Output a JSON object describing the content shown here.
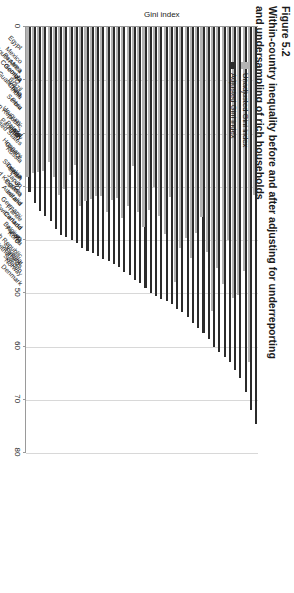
{
  "figure": {
    "number": "Figure 5.2",
    "title_line1": "Within-country inequality before and after adjusting for underreporting",
    "title_line2": "and undersampling of rich households"
  },
  "legend": {
    "position": "top-left-inside",
    "items": [
      {
        "label": "Unadjusted Gini index",
        "color": "#b3b3b3"
      },
      {
        "label": "Adjusted Gini index",
        "color": "#2b2b2b"
      }
    ]
  },
  "axis": {
    "y_title": "Gini index",
    "ticks": [
      "0",
      "10",
      "20",
      "30",
      "40",
      "50",
      "60",
      "70",
      "80"
    ]
  },
  "chart_data": {
    "type": "bar",
    "orientation": "horizontal",
    "title": "Within-country inequality before and after adjusting for underreporting and undersampling of rich households",
    "xlabel": "",
    "ylabel": "Gini index",
    "ylim": [
      0,
      80
    ],
    "grid": true,
    "legend_position": "top-left-inside",
    "categories": [
      "Egypt",
      "South Africa",
      "Mexico",
      "Panama",
      "Colombia",
      "Georgia",
      "Guatemala",
      "Dominican Republic",
      "Brazil",
      "China",
      "India",
      "Serbia",
      "Peru",
      "Uruguay",
      "United States",
      "Paraguay",
      "Poland",
      "Israel",
      "Italy",
      "Hungary",
      "Greece",
      "Russia",
      "United Kingdom",
      "Slovakia",
      "Taiwan",
      "Spain",
      "Japan",
      "Estonia",
      "Australia",
      "Ireland",
      "Germany",
      "Switzerland",
      "France",
      "Canada",
      "Czech Republic",
      "Belgium",
      "Austria",
      "Korea",
      "Netherlands",
      "Slovenia",
      "Finland",
      "Sweden",
      "Norway",
      "Denmark"
    ],
    "series": [
      {
        "name": "Unadjusted Gini index",
        "color": "#b3b3b3",
        "values": [
          31.5,
          63.0,
          45.8,
          50.4,
          50.8,
          40.0,
          48.3,
          45.2,
          53.3,
          42.2,
          35.7,
          38.6,
          43.3,
          39.7,
          41.5,
          47.9,
          32.0,
          38.9,
          35.4,
          30.0,
          34.4,
          37.5,
          34.8,
          26.1,
          33.6,
          35.9,
          32.1,
          32.4,
          34.7,
          31.8,
          31.7,
          32.3,
          32.7,
          33.7,
          25.9,
          27.7,
          30.5,
          31.6,
          28.2,
          25.4,
          27.1,
          27.3,
          27.5,
          28.2
        ]
      },
      {
        "name": "Adjusted Gini index",
        "color": "#2b2b2b",
        "values": [
          74.5,
          72.0,
          68.5,
          66.0,
          64.5,
          63.0,
          62.0,
          61.0,
          60.0,
          58.5,
          57.5,
          56.5,
          55.5,
          54.5,
          53.5,
          53.0,
          52.0,
          51.5,
          51.0,
          50.5,
          50.0,
          49.0,
          48.0,
          47.5,
          46.5,
          46.0,
          45.0,
          44.5,
          44.0,
          43.5,
          43.0,
          42.5,
          42.0,
          41.5,
          40.5,
          40.0,
          39.5,
          39.0,
          38.0,
          36.5,
          35.5,
          34.5,
          33.0,
          31.0
        ]
      }
    ]
  }
}
